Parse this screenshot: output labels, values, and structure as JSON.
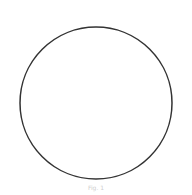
{
  "figure": {
    "shape": "circle",
    "stroke_color": "#333333",
    "fill_color": "#ffffff",
    "top_text": "",
    "caption": "Fig. 1"
  }
}
